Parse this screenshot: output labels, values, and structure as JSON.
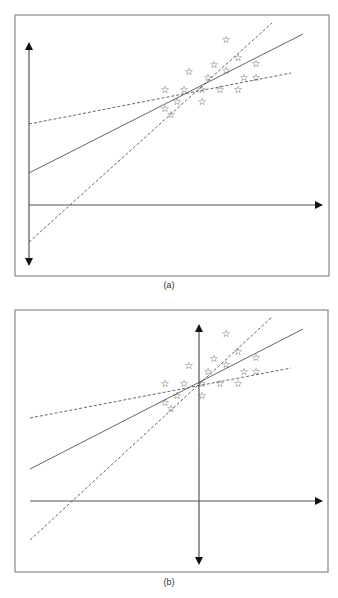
{
  "figure": {
    "panels": [
      {
        "label": "(a)",
        "frame": {
          "x1": 15,
          "y1": 15,
          "x2": 329,
          "y2": 276
        },
        "y_axis": {
          "x": 29,
          "y_top": 44,
          "y_bottom": 264
        },
        "x_axis": {
          "y": 205,
          "x_start": 29,
          "x_end": 321
        },
        "lines": [
          {
            "name": "regression-line",
            "style": "solid",
            "x1": 29,
            "y1": 173,
            "x2": 303,
            "y2": 34
          },
          {
            "name": "shallow-dashed-line",
            "style": "dashed",
            "x1": 29,
            "y1": 124,
            "x2": 291,
            "y2": 73
          },
          {
            "name": "steep-dashed-line",
            "style": "dashed",
            "x1": 29,
            "y1": 242,
            "x2": 272,
            "y2": 23
          }
        ],
        "y_offset": 0
      },
      {
        "label": "(b)",
        "frame": {
          "x1": 15,
          "y1": 310,
          "x2": 328,
          "y2": 572
        },
        "y_axis": {
          "x": 199,
          "y_top": 326,
          "y_bottom": 563
        },
        "x_axis": {
          "y": 501,
          "x_start": 30,
          "x_end": 321
        },
        "lines": [
          {
            "name": "regression-line",
            "style": "solid",
            "x1": 30,
            "y1": 469,
            "x2": 303,
            "y2": 329
          },
          {
            "name": "shallow-dashed-line",
            "style": "dashed",
            "x1": 30,
            "y1": 418,
            "x2": 291,
            "y2": 368
          },
          {
            "name": "steep-dashed-line",
            "style": "dashed",
            "x1": 30,
            "y1": 540,
            "x2": 272,
            "y2": 317
          }
        ],
        "y_offset": 294
      }
    ],
    "data_points": [
      [
        226,
        39
      ],
      [
        238,
        57
      ],
      [
        214,
        64
      ],
      [
        189,
        71
      ],
      [
        226,
        70
      ],
      [
        256,
        63
      ],
      [
        208,
        77
      ],
      [
        244,
        77
      ],
      [
        256,
        77
      ],
      [
        165,
        89
      ],
      [
        184,
        89
      ],
      [
        202,
        89
      ],
      [
        220,
        89
      ],
      [
        238,
        89
      ],
      [
        165,
        108
      ],
      [
        177,
        101
      ],
      [
        202,
        101
      ],
      [
        171,
        114
      ]
    ],
    "marker": "☆",
    "colors": {
      "line": "#555555",
      "frame": "#888888",
      "axis": "#555555",
      "marker": "#333333"
    }
  }
}
